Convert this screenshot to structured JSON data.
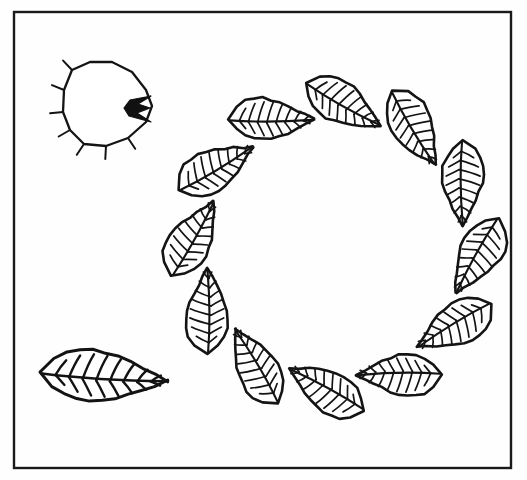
{
  "figure": {
    "background_color": "#fefefe",
    "ink_color": "#141414",
    "canvas": {
      "width": 527,
      "height": 480
    }
  },
  "frame": {
    "name": "plate-border",
    "x": 14,
    "y": 12,
    "width": 497,
    "height": 456,
    "stroke_color": "#1a1a1a",
    "stroke_width": 2.4
  },
  "wreath": {
    "name": "leaf-wreath",
    "center_x": 335,
    "center_y": 247,
    "ring_radius": 142,
    "leaf_count": 12,
    "leaf_length": 86,
    "leaf_half_width": 23,
    "vein_pairs": 8,
    "start_angle_deg": -86,
    "leaf_tilt_deg": 26
  },
  "shell_detail": {
    "name": "shell-detail",
    "center_x": 108,
    "center_y": 108,
    "outline_points": "72,70 90,62 112,62 132,72 146,90 152,106 146,122 128,138 106,146 84,144 70,130 63,112 64,90",
    "tick_count": 7,
    "tick_length": 13,
    "umbo_fill": "#111111",
    "umbo_points": "151,96 138,104 150,108 137,113 151,122 129,116 124,108 130,100"
  },
  "specimen_detail": {
    "name": "detached-leaf-specimen",
    "tip_x": 168,
    "tip_y": 381,
    "base_x": 40,
    "base_y": 372,
    "length": 128,
    "half_width": 28,
    "vein_pairs": 8
  },
  "palette": {
    "ink": "#141414",
    "paper": "#fefefe",
    "frame": "#1a1a1a",
    "fill_dark": "#111111"
  }
}
